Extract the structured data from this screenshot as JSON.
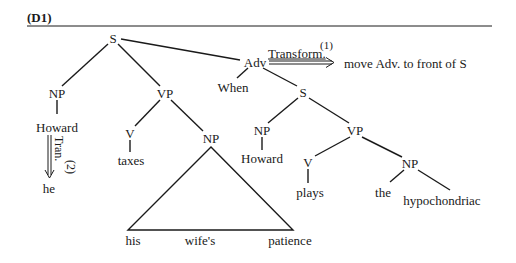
{
  "title": "(D1)",
  "tree": {
    "root": "S",
    "left_np": {
      "label": "NP",
      "word": "Howard",
      "transformed_word": "he"
    },
    "left_vp": {
      "label": "VP",
      "v": "V",
      "verb": "taxes",
      "np": "NP",
      "np_words": [
        "his",
        "wife's",
        "patience"
      ]
    },
    "adv": {
      "label": "Adv",
      "word": "When"
    },
    "sub_s": {
      "label": "S",
      "np": {
        "label": "NP",
        "word": "Howard"
      },
      "vp": {
        "label": "VP",
        "v": "V",
        "verb": "plays",
        "np": "NP",
        "np_words": [
          "the",
          "hypochondriac"
        ]
      }
    }
  },
  "transforms": [
    {
      "label": "Transform.",
      "number": "(1)",
      "description": "move Adv. to front of S"
    },
    {
      "label": "Tran.",
      "number": "(2)"
    }
  ],
  "colors": {
    "ink": "#1a1a1a",
    "background": "#ffffff"
  }
}
